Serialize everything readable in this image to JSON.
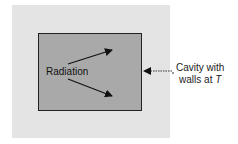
{
  "diagram": {
    "inner_label": "Radiation",
    "outer_label_line1": "Cavity with",
    "outer_label_line2_prefix": "walls at ",
    "outer_label_temp": "T",
    "colors": {
      "outer_fill": "#e4e4e4",
      "inner_fill": "#a9a9a9",
      "border": "#222222"
    }
  }
}
